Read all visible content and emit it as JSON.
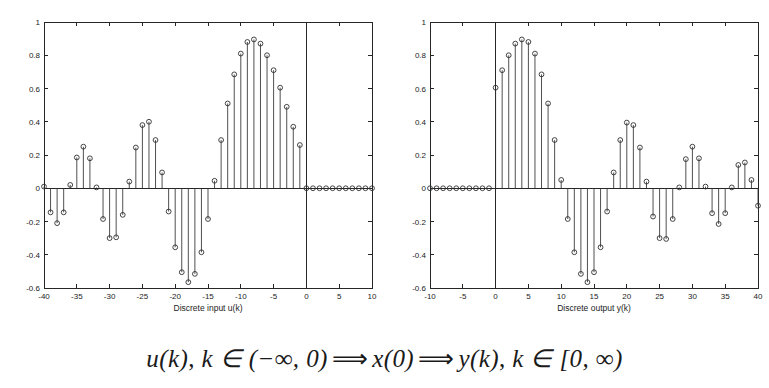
{
  "figure": {
    "caption_parts": {
      "u_of_k": "u(k)",
      "comma1": ", ",
      "k_in_1": "k ∈ (−∞, 0)",
      "arrow1": "⟹",
      "x_of_0": "x(0)",
      "arrow2": "⟹",
      "y_of_k": "y(k)",
      "comma2": ", ",
      "k_in_2": "k ∈ [0, ∞)"
    },
    "caption_full": "u(k), k ∈ (−∞, 0) ⟹ x(0) ⟹ y(k), k ∈ [0, ∞)"
  },
  "chart_data": [
    {
      "id": "left",
      "type": "stem",
      "title": "",
      "xlabel": "Discrete input u(k)",
      "ylabel": "",
      "xlim": [
        -40,
        10
      ],
      "ylim": [
        -0.6,
        1
      ],
      "xticks": [
        -40,
        -35,
        -30,
        -25,
        -20,
        -15,
        -10,
        -5,
        0,
        5,
        10
      ],
      "xticklabels": [
        "-40",
        "-35",
        "-30",
        "-25",
        "-20",
        "-15",
        "-10",
        "-5",
        "0",
        "5",
        "10"
      ],
      "yticks": [
        -0.6,
        -0.4,
        -0.2,
        0,
        0.2,
        0.4,
        0.6,
        0.8,
        1
      ],
      "yticklabels": [
        "-0.6",
        "-0.4",
        "-0.2",
        "0",
        "0.2",
        "0.4",
        "0.6",
        "0.8",
        "1"
      ],
      "grid": false,
      "legend": false,
      "marker": "circle",
      "x": [
        -40,
        -39,
        -38,
        -37,
        -36,
        -35,
        -34,
        -33,
        -32,
        -31,
        -30,
        -29,
        -28,
        -27,
        -26,
        -25,
        -24,
        -23,
        -22,
        -21,
        -20,
        -19,
        -18,
        -17,
        -16,
        -15,
        -14,
        -13,
        -12,
        -11,
        -10,
        -9,
        -8,
        -7,
        -6,
        -5,
        -4,
        -3,
        -2,
        -1,
        0,
        1,
        2,
        3,
        4,
        5,
        6,
        7,
        8,
        9,
        10
      ],
      "values": [
        0.01,
        -0.145,
        -0.21,
        -0.145,
        0.02,
        0.185,
        0.25,
        0.18,
        0.005,
        -0.185,
        -0.3,
        -0.295,
        -0.16,
        0.04,
        0.245,
        0.38,
        0.4,
        0.29,
        0.095,
        -0.14,
        -0.355,
        -0.505,
        -0.565,
        -0.515,
        -0.385,
        -0.185,
        0.045,
        0.29,
        0.51,
        0.685,
        0.81,
        0.88,
        0.895,
        0.87,
        0.8,
        0.71,
        0.605,
        0.49,
        0.37,
        0.26,
        0,
        0,
        0,
        0,
        0,
        0,
        0,
        0,
        0,
        0,
        0
      ]
    },
    {
      "id": "right",
      "type": "stem",
      "title": "",
      "xlabel": "Discrete output y(k)",
      "ylabel": "",
      "xlim": [
        -10,
        40
      ],
      "ylim": [
        -0.6,
        1
      ],
      "xticks": [
        -10,
        -5,
        0,
        5,
        10,
        15,
        20,
        25,
        30,
        35,
        40
      ],
      "xticklabels": [
        "-10",
        "-5",
        "0",
        "5",
        "10",
        "15",
        "20",
        "25",
        "30",
        "35",
        "40"
      ],
      "yticks": [
        -0.6,
        -0.4,
        -0.2,
        0,
        0.2,
        0.4,
        0.6,
        0.8,
        1
      ],
      "yticklabels": [
        "-0.6",
        "-0.4",
        "-0.2",
        "0",
        "0.2",
        "0.4",
        "0.6",
        "0.8",
        "1"
      ],
      "grid": false,
      "legend": false,
      "marker": "circle",
      "x": [
        -10,
        -9,
        -8,
        -7,
        -6,
        -5,
        -4,
        -3,
        -2,
        -1,
        0,
        1,
        2,
        3,
        4,
        5,
        6,
        7,
        8,
        9,
        10,
        11,
        12,
        13,
        14,
        15,
        16,
        17,
        18,
        19,
        20,
        21,
        22,
        23,
        24,
        25,
        26,
        27,
        28,
        29,
        30,
        31,
        32,
        33,
        34,
        35,
        36,
        37,
        38,
        39,
        40
      ],
      "values": [
        0,
        0,
        0,
        0,
        0,
        0,
        0,
        0,
        0,
        0,
        0.605,
        0.71,
        0.8,
        0.87,
        0.895,
        0.88,
        0.81,
        0.685,
        0.51,
        0.29,
        0.05,
        -0.185,
        -0.385,
        -0.515,
        -0.565,
        -0.505,
        -0.355,
        -0.14,
        0.095,
        0.29,
        0.395,
        0.38,
        0.245,
        0.04,
        -0.17,
        -0.3,
        -0.305,
        -0.185,
        0.005,
        0.175,
        0.25,
        0.18,
        0.01,
        -0.15,
        -0.215,
        -0.15,
        0.005,
        0.14,
        0.155,
        0.05,
        -0.105
      ]
    }
  ]
}
